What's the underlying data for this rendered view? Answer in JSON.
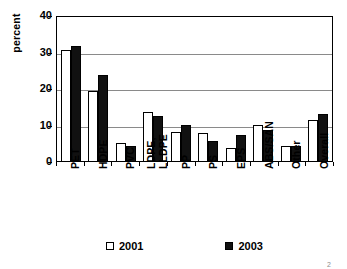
{
  "chart_data": {
    "type": "bar",
    "title": "",
    "subtitle": "",
    "xlabel": "",
    "ylabel": "percent",
    "ylim": [
      0,
      40
    ],
    "yticks": [
      0,
      10,
      20,
      30,
      40
    ],
    "grid": true,
    "grid_axis": "y",
    "legend_position": "bottom",
    "categories": [
      "PET",
      "HDPE",
      "PVC",
      "LDPE,\nLLDPE",
      "PP",
      "PS",
      "EPS",
      "ABS/SAN",
      "Other",
      "Overall"
    ],
    "series": [
      {
        "name": "2001",
        "color": "#ffffff",
        "values": [
          30.5,
          19.3,
          5.0,
          13.3,
          8.0,
          7.7,
          3.7,
          10.0,
          4.2,
          11.3
        ]
      },
      {
        "name": "2003",
        "color": "#111111",
        "values": [
          31.5,
          23.5,
          4.2,
          12.3,
          10.0,
          5.4,
          7.2,
          8.6,
          4.1,
          12.8
        ]
      }
    ]
  },
  "legend": {
    "items": [
      {
        "label": "2001",
        "swatch": "white"
      },
      {
        "label": "2003",
        "swatch": "black"
      }
    ]
  },
  "axis": {
    "y_label": "percent",
    "y_tick_labels": [
      "0",
      "10",
      "20",
      "30",
      "40"
    ]
  },
  "colors": {
    "series_2001": "#ffffff",
    "series_2003": "#111111",
    "axis": "#000000",
    "gridline": "#8a8a8a",
    "background": "#ffffff"
  },
  "footnote": "2"
}
